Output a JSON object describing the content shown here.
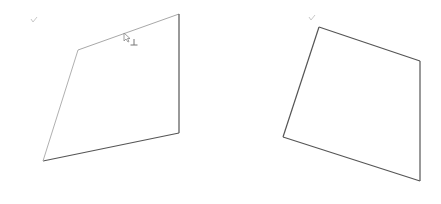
{
  "canvas": {
    "background": "#ffffff"
  },
  "shapes": [
    {
      "name": "left-quadrilateral",
      "edges": [
        {
          "name": "top-edge",
          "color": "#a8a8a8"
        },
        {
          "name": "right-edge",
          "color": "#555555"
        },
        {
          "name": "bottom-edge",
          "color": "#555555"
        },
        {
          "name": "left-edge",
          "color": "#b0b0b0"
        }
      ],
      "has_check_mark": true,
      "has_perpendicular_marker": true
    },
    {
      "name": "right-quadrilateral",
      "edges": [
        {
          "name": "top-edge",
          "color": "#555555"
        },
        {
          "name": "right-edge",
          "color": "#555555"
        },
        {
          "name": "bottom-edge",
          "color": "#555555"
        },
        {
          "name": "left-edge",
          "color": "#555555"
        }
      ],
      "has_check_mark": true,
      "has_perpendicular_marker": false
    }
  ],
  "markers": {
    "perpendicular_symbol": "⊥",
    "check_symbol": "✓"
  }
}
